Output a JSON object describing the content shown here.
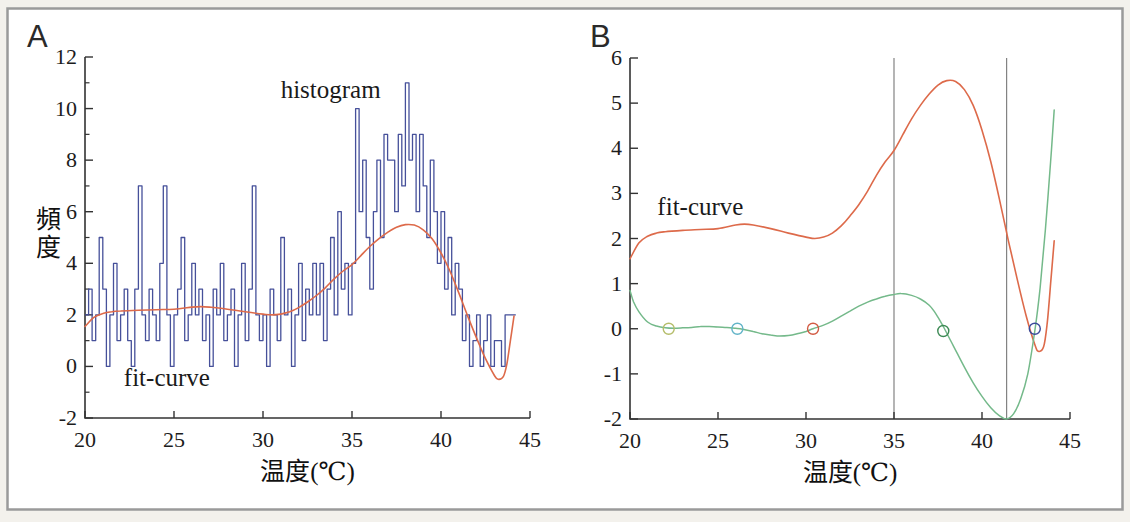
{
  "figure": {
    "panel_a_label": "A",
    "panel_b_label": "B"
  },
  "colors": {
    "background": "#ffffff",
    "frame": "#9a9a9a",
    "axis": "#333333",
    "histogram": "#46509a",
    "fit_curve": "#dd6a4a",
    "derivative": "#74b98a",
    "vline": "#777777",
    "marker_olive": "#b5bd6a",
    "marker_cyan": "#62b4c8",
    "marker_red": "#d25a42",
    "marker_green": "#3d8a55",
    "marker_blue": "#3a4a9a"
  },
  "chart_data": [
    {
      "type": "line",
      "panel": "A",
      "title": "",
      "xlabel": "温度(℃)",
      "ylabel": "頻度",
      "xlim": [
        20,
        45
      ],
      "ylim": [
        -2,
        12
      ],
      "xticks": [
        20,
        25,
        30,
        35,
        40,
        45
      ],
      "yticks_labeled": [
        -2,
        0,
        2,
        4,
        6,
        8,
        10,
        12
      ],
      "yticks_minor": [
        -1,
        1,
        3,
        5,
        7,
        9,
        11
      ],
      "grid": false,
      "annotations": [
        {
          "text": "histogram",
          "x": 33.8,
          "y": 10.4
        },
        {
          "text": "fit-curve",
          "x": 24.6,
          "y": -0.75
        }
      ],
      "series": [
        {
          "name": "histogram",
          "style": "step",
          "color_key": "histogram",
          "x_start": 20,
          "x_step": 0.2,
          "values": [
            2,
            3,
            1,
            2,
            5,
            3,
            0,
            2,
            4,
            1,
            2,
            3,
            1,
            0,
            3,
            7,
            2,
            1,
            3,
            2,
            1,
            4,
            7,
            2,
            0,
            2,
            3,
            5,
            1,
            2,
            4,
            2,
            3,
            1,
            2,
            0,
            3,
            2,
            4,
            1,
            2,
            3,
            0,
            2,
            4,
            1,
            3,
            7,
            2,
            1,
            2,
            0,
            3,
            2,
            1,
            5,
            2,
            3,
            0,
            2,
            4,
            1,
            3,
            2,
            4,
            2,
            4,
            1,
            3,
            5,
            2,
            6,
            3,
            4,
            2,
            4,
            10,
            6,
            8,
            5,
            3,
            6,
            8,
            5,
            9,
            8,
            8,
            6,
            9,
            7,
            11,
            8,
            9,
            6,
            9,
            7,
            5,
            8,
            6,
            4,
            6,
            3,
            5,
            2,
            4,
            3,
            1,
            2,
            0,
            1,
            2,
            0,
            1,
            2,
            0,
            1,
            1,
            0,
            2,
            2,
            2
          ]
        },
        {
          "name": "fit-curve",
          "style": "smooth",
          "color_key": "fit_curve",
          "points": [
            [
              20,
              1.55
            ],
            [
              20.5,
              1.9
            ],
            [
              21,
              2.05
            ],
            [
              21.5,
              2.12
            ],
            [
              22,
              2.15
            ],
            [
              23,
              2.18
            ],
            [
              24,
              2.2
            ],
            [
              25,
              2.22
            ],
            [
              26,
              2.3
            ],
            [
              26.5,
              2.32
            ],
            [
              27,
              2.3
            ],
            [
              28,
              2.22
            ],
            [
              29,
              2.12
            ],
            [
              30,
              2.03
            ],
            [
              30.5,
              2.0
            ],
            [
              31,
              2.03
            ],
            [
              31.5,
              2.12
            ],
            [
              32,
              2.28
            ],
            [
              32.5,
              2.5
            ],
            [
              33,
              2.75
            ],
            [
              33.5,
              3.05
            ],
            [
              34,
              3.4
            ],
            [
              34.5,
              3.7
            ],
            [
              35,
              3.95
            ],
            [
              35.5,
              4.3
            ],
            [
              36,
              4.65
            ],
            [
              36.5,
              4.95
            ],
            [
              37,
              5.2
            ],
            [
              37.5,
              5.4
            ],
            [
              38,
              5.5
            ],
            [
              38.5,
              5.48
            ],
            [
              39,
              5.3
            ],
            [
              39.5,
              4.95
            ],
            [
              40,
              4.4
            ],
            [
              40.5,
              3.7
            ],
            [
              41,
              2.85
            ],
            [
              41.5,
              1.95
            ],
            [
              42,
              1.1
            ],
            [
              42.5,
              0.3
            ],
            [
              43,
              -0.35
            ],
            [
              43.2,
              -0.5
            ],
            [
              43.5,
              -0.4
            ],
            [
              43.7,
              0.1
            ],
            [
              43.9,
              1.0
            ],
            [
              44.1,
              1.95
            ]
          ]
        }
      ]
    },
    {
      "type": "line",
      "panel": "B",
      "title": "",
      "xlabel": "温度(℃)",
      "ylabel": "",
      "xlim": [
        20,
        45
      ],
      "ylim": [
        -2,
        6
      ],
      "xticks": [
        20,
        25,
        30,
        35,
        40,
        45
      ],
      "yticks_labeled": [
        -2,
        -1,
        0,
        1,
        2,
        3,
        4,
        5,
        6
      ],
      "yticks_minor": [],
      "grid": false,
      "vlines": [
        35,
        41.4
      ],
      "annotations": [
        {
          "text": "fit-curve",
          "x": 24.0,
          "y": 2.53
        }
      ],
      "series": [
        {
          "name": "fit-curve",
          "style": "smooth",
          "color_key": "fit_curve",
          "points": [
            [
              20,
              1.55
            ],
            [
              20.5,
              1.9
            ],
            [
              21,
              2.05
            ],
            [
              21.5,
              2.12
            ],
            [
              22,
              2.15
            ],
            [
              23,
              2.18
            ],
            [
              24,
              2.2
            ],
            [
              25,
              2.22
            ],
            [
              26,
              2.3
            ],
            [
              26.5,
              2.32
            ],
            [
              27,
              2.3
            ],
            [
              28,
              2.22
            ],
            [
              29,
              2.12
            ],
            [
              30,
              2.03
            ],
            [
              30.5,
              2.0
            ],
            [
              31,
              2.03
            ],
            [
              31.5,
              2.12
            ],
            [
              32,
              2.28
            ],
            [
              32.5,
              2.5
            ],
            [
              33,
              2.75
            ],
            [
              33.5,
              3.05
            ],
            [
              34,
              3.4
            ],
            [
              34.5,
              3.7
            ],
            [
              35,
              3.95
            ],
            [
              35.5,
              4.3
            ],
            [
              36,
              4.65
            ],
            [
              36.5,
              4.95
            ],
            [
              37,
              5.2
            ],
            [
              37.5,
              5.4
            ],
            [
              38,
              5.5
            ],
            [
              38.5,
              5.48
            ],
            [
              39,
              5.3
            ],
            [
              39.5,
              4.95
            ],
            [
              40,
              4.4
            ],
            [
              40.5,
              3.7
            ],
            [
              41,
              2.85
            ],
            [
              41.5,
              1.95
            ],
            [
              42,
              1.1
            ],
            [
              42.5,
              0.3
            ],
            [
              43,
              -0.35
            ],
            [
              43.2,
              -0.5
            ],
            [
              43.5,
              -0.4
            ],
            [
              43.7,
              0.1
            ],
            [
              43.9,
              1.0
            ],
            [
              44.1,
              1.95
            ]
          ]
        },
        {
          "name": "derivative",
          "style": "smooth",
          "color_key": "derivative",
          "points": [
            [
              20,
              0.85
            ],
            [
              20.2,
              0.6
            ],
            [
              20.5,
              0.38
            ],
            [
              21,
              0.15
            ],
            [
              21.5,
              0.06
            ],
            [
              22,
              0.02
            ],
            [
              22.5,
              0.01
            ],
            [
              23,
              0.02
            ],
            [
              23.5,
              0.03
            ],
            [
              24,
              0.05
            ],
            [
              24.5,
              0.05
            ],
            [
              25,
              0.04
            ],
            [
              25.5,
              0.03
            ],
            [
              26,
              0.01
            ],
            [
              26.4,
              -0.01
            ],
            [
              27,
              -0.06
            ],
            [
              27.5,
              -0.11
            ],
            [
              28,
              -0.14
            ],
            [
              28.5,
              -0.16
            ],
            [
              29,
              -0.15
            ],
            [
              29.5,
              -0.11
            ],
            [
              30,
              -0.06
            ],
            [
              30.4,
              0.0
            ],
            [
              31,
              0.08
            ],
            [
              31.5,
              0.17
            ],
            [
              32,
              0.28
            ],
            [
              32.5,
              0.39
            ],
            [
              33,
              0.5
            ],
            [
              33.5,
              0.59
            ],
            [
              34,
              0.66
            ],
            [
              34.5,
              0.72
            ],
            [
              35,
              0.76
            ],
            [
              35.4,
              0.78
            ],
            [
              36,
              0.74
            ],
            [
              36.5,
              0.66
            ],
            [
              37,
              0.52
            ],
            [
              37.4,
              0.32
            ],
            [
              37.8,
              0.05
            ],
            [
              38.2,
              -0.25
            ],
            [
              38.6,
              -0.55
            ],
            [
              39,
              -0.85
            ],
            [
              39.5,
              -1.2
            ],
            [
              40,
              -1.5
            ],
            [
              40.5,
              -1.75
            ],
            [
              41,
              -1.93
            ],
            [
              41.4,
              -2.0
            ],
            [
              41.8,
              -1.88
            ],
            [
              42.2,
              -1.55
            ],
            [
              42.6,
              -1.0
            ],
            [
              43.0,
              -0.05
            ],
            [
              43.3,
              0.9
            ],
            [
              43.6,
              2.2
            ],
            [
              43.9,
              3.7
            ],
            [
              44.1,
              4.85
            ]
          ]
        }
      ],
      "markers": [
        {
          "x": 22.2,
          "y": 0,
          "color_key": "marker_olive"
        },
        {
          "x": 26.1,
          "y": 0,
          "color_key": "marker_cyan"
        },
        {
          "x": 30.4,
          "y": 0,
          "color_key": "marker_red"
        },
        {
          "x": 37.8,
          "y": -0.05,
          "color_key": "marker_green"
        },
        {
          "x": 43.0,
          "y": 0,
          "color_key": "marker_blue"
        }
      ]
    }
  ]
}
